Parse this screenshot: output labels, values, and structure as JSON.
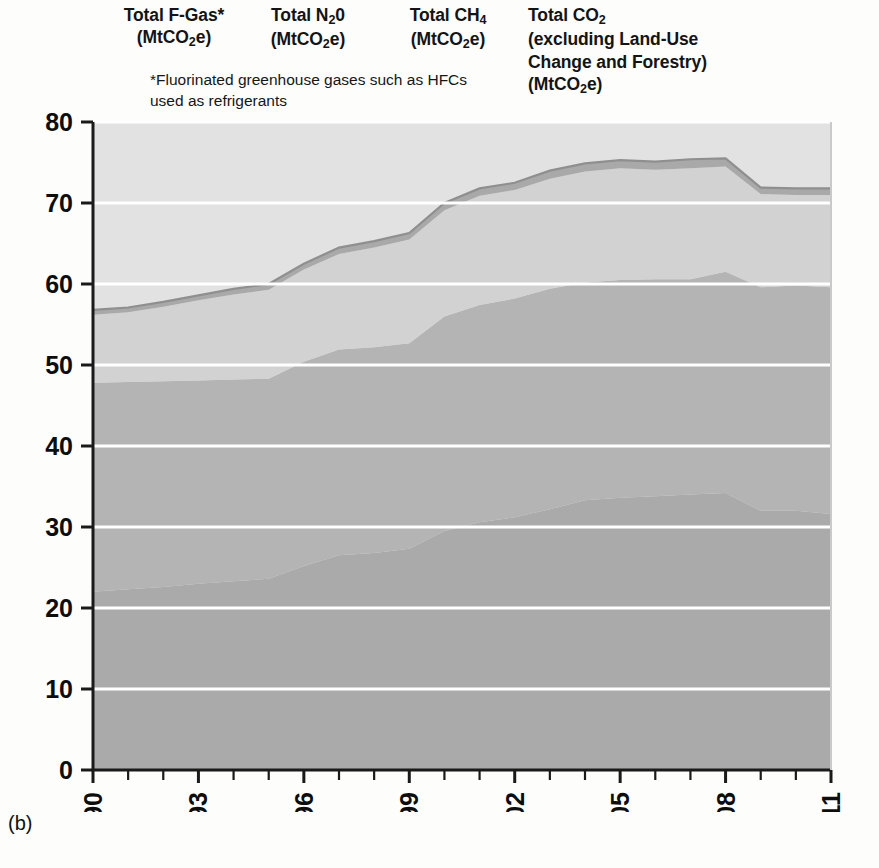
{
  "panel": {
    "letter": "(b)"
  },
  "legend": {
    "items": [
      {
        "name": "f-gas",
        "line1": "Total F-Gas*",
        "line2": "(MtCO2e)"
      },
      {
        "name": "n2o",
        "line1": "Total N2O",
        "line2": "(MtCO2e)"
      },
      {
        "name": "ch4",
        "line1": "Total CH4",
        "line2": "(MtCO2e)"
      },
      {
        "name": "co2",
        "line1": "Total CO2",
        "line2": "(excluding Land-Use",
        "line3": "Change and Forestry)",
        "line4": "(MtCO2e)"
      }
    ],
    "footnote": "*Fluorinated greenhouse gases such as HFCs used as refrigerants"
  },
  "colors": {
    "plot_background": "#e2e2e2",
    "f_gas_band": "#a9a9a9",
    "n2o_band": "#d2d2d2",
    "ch4_band": "#b4b4b4",
    "co2_band": "#aaaaaa",
    "gridline": "#ffffff",
    "axis": "#1a1a1a",
    "text": "#111111"
  },
  "chart_data": {
    "type": "area",
    "stacked": true,
    "title": "",
    "xlabel": "",
    "ylabel": "",
    "grid": true,
    "legend_position": "top",
    "xlim": [
      1990,
      2011
    ],
    "ylim": [
      0,
      80
    ],
    "yticks": [
      0,
      10,
      20,
      30,
      40,
      50,
      60,
      70,
      80
    ],
    "ytick_labels": [
      "0",
      "10",
      "20",
      "30",
      "40",
      "50",
      "60",
      "70",
      "80"
    ],
    "xticks": [
      1990,
      1993,
      1996,
      1999,
      2002,
      2005,
      2008,
      2011
    ],
    "xtick_labels": [
      "1990",
      "1993",
      "1996",
      "1999",
      "2002",
      "2005",
      "2008",
      "2011"
    ],
    "x_minor_ticks": [
      1991,
      1992,
      1994,
      1995,
      1997,
      1998,
      2000,
      2001,
      2003,
      2004,
      2006,
      2007,
      2009,
      2010
    ],
    "x": [
      1990,
      1991,
      1992,
      1993,
      1994,
      1995,
      1996,
      1997,
      1998,
      1999,
      2000,
      2001,
      2002,
      2003,
      2004,
      2005,
      2006,
      2007,
      2008,
      2009,
      2010,
      2011
    ],
    "series": [
      {
        "name": "Total CO2 (excluding Land-Use Change and Forestry)",
        "color": "#aaaaaa",
        "values": [
          22.0,
          22.3,
          22.6,
          23.0,
          23.3,
          23.6,
          25.2,
          26.5,
          26.8,
          27.3,
          29.5,
          30.6,
          31.2,
          32.2,
          33.3,
          33.6,
          33.8,
          34.0,
          34.2,
          32.0,
          32.0,
          31.6
        ]
      },
      {
        "name": "Total CH4",
        "color": "#b4b4b4",
        "values": [
          25.8,
          25.6,
          25.4,
          25.1,
          24.9,
          24.7,
          25.2,
          25.4,
          25.4,
          25.4,
          26.5,
          26.8,
          27.0,
          27.2,
          26.9,
          26.9,
          26.8,
          26.6,
          27.3,
          27.6,
          27.8,
          28.0
        ]
      },
      {
        "name": "Total N2O",
        "color": "#d2d2d2",
        "values": [
          8.4,
          8.6,
          9.2,
          9.9,
          10.5,
          11.0,
          11.4,
          11.8,
          12.3,
          12.8,
          13.1,
          13.5,
          13.4,
          13.6,
          13.7,
          13.8,
          13.5,
          13.7,
          13.0,
          11.5,
          11.2,
          11.4
        ]
      },
      {
        "name": "Total F-Gas*",
        "color": "#a9a9a9",
        "values": [
          0.6,
          0.6,
          0.6,
          0.6,
          0.7,
          0.7,
          0.7,
          0.8,
          0.8,
          0.8,
          0.9,
          0.9,
          0.9,
          1.0,
          1.0,
          1.0,
          1.0,
          1.1,
          1.0,
          0.8,
          0.8,
          0.8
        ]
      }
    ],
    "totals": [
      56.8,
      57.1,
      57.8,
      58.6,
      59.4,
      60.0,
      62.5,
      64.5,
      65.3,
      66.3,
      70.0,
      71.8,
      72.5,
      74.0,
      74.9,
      75.3,
      75.1,
      75.4,
      75.5,
      71.9,
      71.8,
      71.8
    ]
  }
}
